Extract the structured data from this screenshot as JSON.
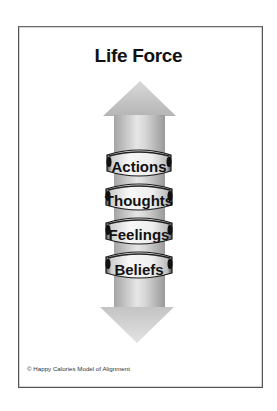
{
  "slide": {
    "title": "Life Force",
    "footer": "© Happy Calories Model of Alignment"
  },
  "diagram": {
    "arrow": {
      "direction": "bidirectional-vertical",
      "fill_light": "#e4e4e4",
      "fill_dark": "#9a9a9a"
    },
    "rings": [
      {
        "label": "Actions"
      },
      {
        "label": "Thoughts"
      },
      {
        "label": "Feelings"
      },
      {
        "label": "Beliefs"
      }
    ],
    "colors": {
      "frame": "#555555",
      "text": "#111111",
      "ring_face": "#f2f2f2",
      "ring_edge": "#1a1a1a"
    }
  }
}
